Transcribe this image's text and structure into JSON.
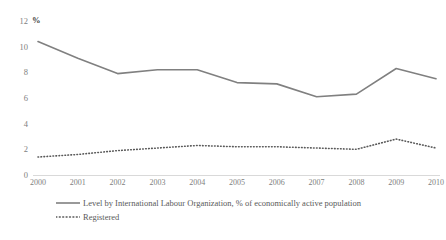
{
  "chart_data": {
    "type": "line",
    "title": "",
    "xlabel": "",
    "ylabel": "%",
    "categories": [
      "2000",
      "2001",
      "2002",
      "2003",
      "2004",
      "2005",
      "2006",
      "2007",
      "2008",
      "2009",
      "2010"
    ],
    "x": [
      2000,
      2001,
      2002,
      2003,
      2004,
      2005,
      2006,
      2007,
      2008,
      2009,
      2010
    ],
    "ylim": [
      0,
      12
    ],
    "xlim": [
      2000,
      2010
    ],
    "yticks": [
      0,
      2,
      4,
      6,
      8,
      10,
      12
    ],
    "ytick_labels": [
      "0",
      "2",
      "4",
      "6",
      "8",
      "10",
      "12"
    ],
    "grid": false,
    "legend_position": "bottom-left",
    "series": [
      {
        "name": "Level by International Labour Organization, % of economically active population",
        "style": "solid",
        "color": "#808080",
        "values": [
          10.4,
          9.1,
          7.9,
          8.2,
          8.2,
          7.2,
          7.1,
          6.1,
          6.3,
          8.3,
          7.5
        ]
      },
      {
        "name": "Registered",
        "style": "dotted",
        "color": "#595959",
        "values": [
          1.4,
          1.6,
          1.9,
          2.1,
          2.3,
          2.2,
          2.2,
          2.1,
          2.0,
          2.8,
          2.1
        ]
      }
    ]
  },
  "axis": {
    "unit_label": "%"
  },
  "legend": {
    "entries": [
      {
        "label": "Level by International Labour Organization, % of economically active population"
      },
      {
        "label": "Registered"
      }
    ]
  }
}
